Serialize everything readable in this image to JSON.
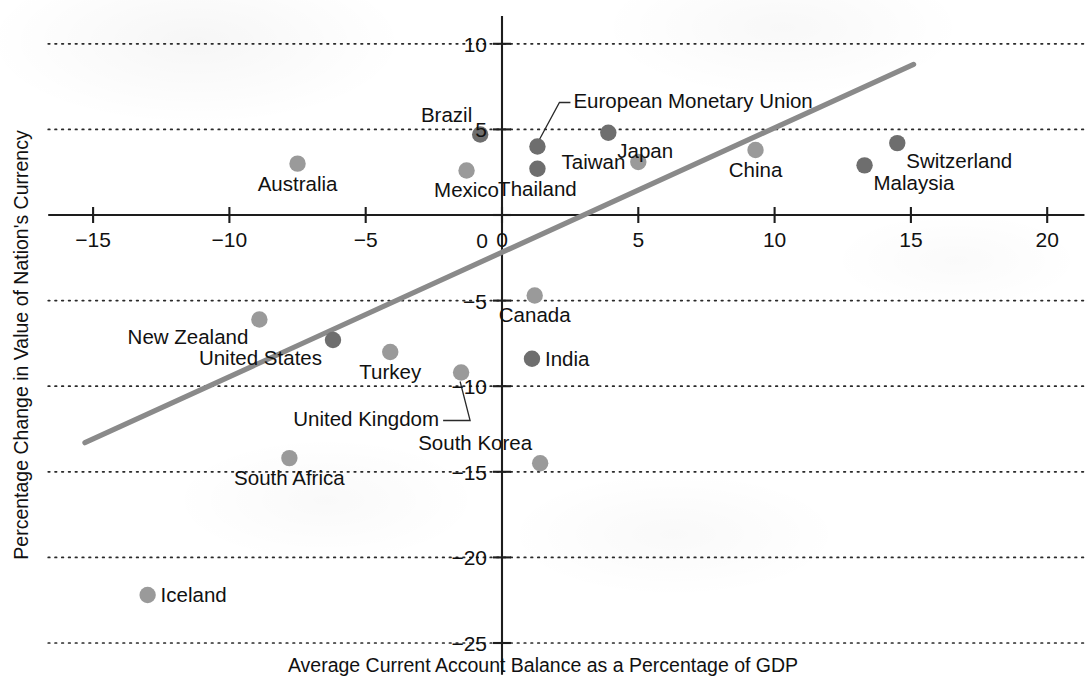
{
  "chart_data": {
    "type": "scatter",
    "title": "",
    "xlabel": "Average Current Account Balance as a Percentage of GDP",
    "ylabel": "Percentage Change in Value of Nation's Currency",
    "xlim": [
      -16.5,
      21.0
    ],
    "ylim": [
      -26.5,
      11.5
    ],
    "xticks": [
      -15,
      -10,
      -5,
      0,
      5,
      10,
      15,
      20
    ],
    "xtick_labels": [
      "−15",
      "−10",
      "−5",
      "0",
      "5",
      "10",
      "15",
      "20"
    ],
    "yticks": [
      10,
      5,
      0,
      -5,
      -10,
      -15,
      -20,
      -25
    ],
    "ytick_labels": [
      "10",
      "5",
      "0",
      "−5",
      "−10",
      "−15",
      "−20",
      "−25"
    ],
    "grid": "horizontal-dotted",
    "legend": "none",
    "colors": {
      "marker_light": "#9a9a9a",
      "marker_dark": "#6e6e6e",
      "trendline": "#8a8a8a",
      "axis": "#1d1d1d",
      "text": "#111111",
      "background": "#ffffff"
    },
    "trendline": {
      "type": "linear-fit",
      "x_start": -15.3,
      "y_start": -13.3,
      "x_end": 15.1,
      "y_end": 8.8
    },
    "points": [
      {
        "label": "Australia",
        "x": -7.5,
        "y": 3.0,
        "shade": "light",
        "label_pos": "below"
      },
      {
        "label": "New Zealand",
        "x": -8.9,
        "y": -6.1,
        "shade": "light",
        "label_pos": "below-left"
      },
      {
        "label": "United States",
        "x": -6.2,
        "y": -7.3,
        "shade": "dark",
        "label_pos": "below-left"
      },
      {
        "label": "Mexico",
        "x": -1.3,
        "y": 2.6,
        "shade": "light",
        "label_pos": "below"
      },
      {
        "label": "Brazil",
        "x": -0.8,
        "y": 4.7,
        "shade": "dark",
        "label_pos": "above-left"
      },
      {
        "label": "European Monetary Union",
        "x": 1.3,
        "y": 4.0,
        "shade": "dark",
        "label_pos": "leader-up-right"
      },
      {
        "label": "Thailand",
        "x": 1.3,
        "y": 2.7,
        "shade": "dark",
        "label_pos": "below"
      },
      {
        "label": "Japan",
        "x": 3.9,
        "y": 4.8,
        "shade": "dark",
        "label_pos": "below-right"
      },
      {
        "label": "Taiwan",
        "x": 5.0,
        "y": 3.1,
        "shade": "light",
        "label_pos": "left"
      },
      {
        "label": "China",
        "x": 9.3,
        "y": 3.8,
        "shade": "light",
        "label_pos": "below"
      },
      {
        "label": "Malaysia",
        "x": 13.3,
        "y": 2.9,
        "shade": "dark",
        "label_pos": "below-right"
      },
      {
        "label": "Switzerland",
        "x": 14.5,
        "y": 4.2,
        "shade": "dark",
        "label_pos": "below-right"
      },
      {
        "label": "Canada",
        "x": 1.2,
        "y": -4.7,
        "shade": "light",
        "label_pos": "below"
      },
      {
        "label": "Turkey",
        "x": -4.1,
        "y": -8.0,
        "shade": "light",
        "label_pos": "below"
      },
      {
        "label": "India",
        "x": 1.1,
        "y": -8.4,
        "shade": "dark",
        "label_pos": "right"
      },
      {
        "label": "United Kingdom",
        "x": -1.5,
        "y": -9.2,
        "shade": "light",
        "label_pos": "leader-down-left"
      },
      {
        "label": "South Korea",
        "x": 1.4,
        "y": -14.5,
        "shade": "light",
        "label_pos": "above-left"
      },
      {
        "label": "South Africa",
        "x": -7.8,
        "y": -14.2,
        "shade": "light",
        "label_pos": "below"
      },
      {
        "label": "Iceland",
        "x": -13.0,
        "y": -22.2,
        "shade": "light",
        "label_pos": "right"
      }
    ]
  },
  "axes": {
    "x_title": "Average Current Account Balance as a Percentage of GDP",
    "y_title": "Percentage Change in Value of Nation's Currency"
  }
}
